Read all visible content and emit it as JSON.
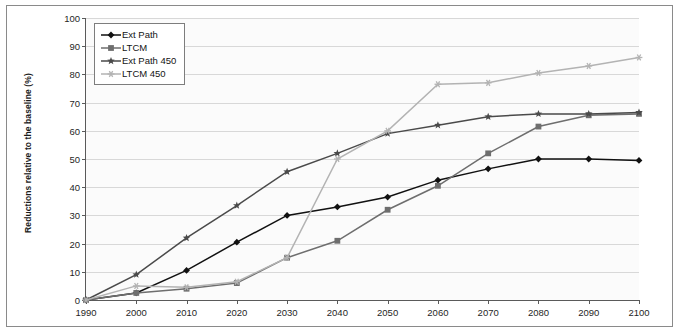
{
  "chart_data": {
    "type": "line",
    "title": "",
    "xlabel": "",
    "ylabel": "Reductions relative to the baseline (%)",
    "xlim": [
      1990,
      2100
    ],
    "ylim": [
      0,
      100
    ],
    "grid": true,
    "legend_position": "top-left",
    "x": [
      1990,
      2000,
      2010,
      2020,
      2030,
      2040,
      2050,
      2060,
      2070,
      2080,
      2090,
      2100
    ],
    "xticks": [
      "1990",
      "2000",
      "2010",
      "2020",
      "2030",
      "2040",
      "2050",
      "2060",
      "2070",
      "2080",
      "2090",
      "2100"
    ],
    "yticks": [
      "0",
      "10",
      "20",
      "30",
      "40",
      "50",
      "60",
      "70",
      "80",
      "90",
      "100"
    ],
    "series": [
      {
        "name": "Ext Path",
        "color": "#111111",
        "marker": "diamond",
        "values": [
          0,
          2.5,
          10.5,
          20.5,
          30,
          33,
          36.5,
          42.5,
          46.5,
          50,
          50,
          49.5
        ]
      },
      {
        "name": "LTCM",
        "color": "#6e6e6e",
        "marker": "square",
        "values": [
          0,
          2.5,
          4,
          6,
          15,
          21,
          32,
          40.5,
          52,
          61.5,
          65.5,
          66
        ]
      },
      {
        "name": "Ext Path 450",
        "color": "#4a4a4a",
        "marker": "star",
        "values": [
          0,
          9,
          22,
          33.5,
          45.5,
          52,
          59,
          62,
          65,
          66,
          66,
          66.5
        ]
      },
      {
        "name": "LTCM 450",
        "color": "#b3b3b3",
        "marker": "asterisk",
        "values": [
          0,
          5,
          4.5,
          6.5,
          15,
          50,
          60,
          76.5,
          77,
          80.5,
          83,
          86
        ]
      }
    ]
  },
  "legend": {
    "items": [
      {
        "label": "Ext Path"
      },
      {
        "label": "LTCM"
      },
      {
        "label": "Ext Path 450"
      },
      {
        "label": "LTCM 450"
      }
    ]
  }
}
